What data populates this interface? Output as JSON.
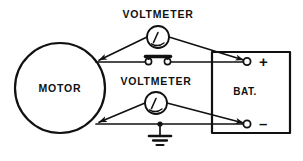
{
  "diagram": {
    "stroke_color": "#111111",
    "background_color": "#ffffff",
    "labels": {
      "voltmeter_top": "VOLTMETER",
      "voltmeter_bottom": "VOLTMETER",
      "motor": "MOTOR",
      "battery": "BAT.",
      "terminal_positive": "+",
      "terminal_negative": "–"
    },
    "components": [
      {
        "name": "motor",
        "type": "circle",
        "label": "MOTOR",
        "cx": 60,
        "cy": 88,
        "r": 45
      },
      {
        "name": "voltmeter-top",
        "type": "gauge",
        "label": "VOLTMETER",
        "cx": 158,
        "cy": 37,
        "r": 11
      },
      {
        "name": "voltmeter-bottom",
        "type": "gauge",
        "label": "VOLTMETER",
        "cx": 156,
        "cy": 103,
        "r": 11
      },
      {
        "name": "switch",
        "type": "closed-switch",
        "x1": 146,
        "y1": 62,
        "x2": 170,
        "y2": 62
      },
      {
        "name": "battery",
        "type": "box",
        "label": "BAT.",
        "x": 212,
        "y": 52,
        "width": 78,
        "height": 81
      },
      {
        "name": "ground",
        "type": "earth-ground",
        "x": 160,
        "y": 127
      },
      {
        "name": "terminal-positive",
        "type": "terminal",
        "label": "+",
        "cx": 247,
        "cy": 61
      },
      {
        "name": "terminal-negative",
        "type": "terminal",
        "label": "–",
        "cx": 247,
        "cy": 124
      }
    ]
  }
}
